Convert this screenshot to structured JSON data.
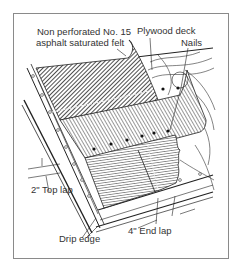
{
  "figure": {
    "labels": {
      "felt_line1": "Non perforated No. 15",
      "felt_line2": "asphalt saturated felt",
      "plywood": "Plywood deck",
      "nails": "Nails",
      "top_lap": "2\" Top lap",
      "drip_edge": "Drip edge",
      "end_lap": "4\" End lap"
    },
    "colors": {
      "frame": "#8a8a8a",
      "ink": "#222222",
      "text": "#333333"
    }
  }
}
